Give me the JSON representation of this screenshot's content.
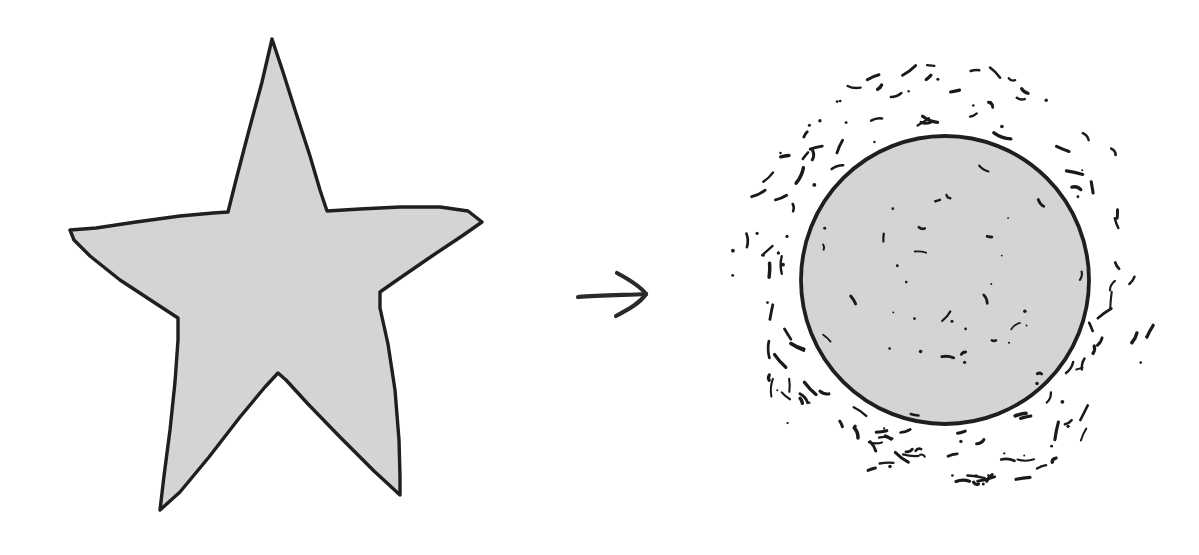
{
  "figure": {
    "background_color": "#ffffff",
    "width": 1199,
    "height": 555,
    "shape_fill_color": "#d4d4d4",
    "outline_color": "#201f1e",
    "mark_color": "#1b1a19",
    "arrow_color": "#2b2a29",
    "relation": "transforms into",
    "arrow_glyph": "→"
  },
  "left_shape": {
    "name": "star",
    "label": "five-pointed star",
    "style": "hand-drawn filled outline",
    "fill": "#d4d4d4",
    "points": 5,
    "center": [
      276,
      280
    ],
    "bounds": [
      70,
      39,
      482,
      510
    ],
    "outer_vertices": [
      [
        272,
        39
      ],
      [
        482,
        222
      ],
      [
        400,
        495
      ],
      [
        160,
        510
      ],
      [
        70,
        230
      ]
    ],
    "inner_vertices": [
      [
        327,
        212
      ],
      [
        380,
        308
      ],
      [
        278,
        373
      ],
      [
        178,
        318
      ],
      [
        228,
        212
      ]
    ],
    "outline_path": "M272,39 L283,72 L296,113 L310,156 L320,190 L327,211 L360,209 L400,207 L440,207 L468,211 L482,222 L462,236 L432,256 L400,278 L380,292 L380,308 L388,344 L395,390 L399,440 L400,476 L400,495 L374,471 L340,437 L308,404 L286,380 L278,373 L265,387 L240,417 L209,457 L180,492 L160,510 L164,476 L170,430 L175,382 L178,340 L178,318 L152,301 L120,280 L90,256 L74,240 L70,230 L96,228 L136,222 L180,216 L213,213 L228,212 L236,180 L248,134 L262,82 Z"
  },
  "middle_symbol": {
    "name": "right-arrow",
    "label": "transformation arrow",
    "glyph": "→",
    "direction": "right",
    "center": [
      611,
      294
    ],
    "shaft_start": [
      578,
      297
    ],
    "shaft_end": [
      646,
      294
    ],
    "barb_upper": [
      617,
      273
    ],
    "barb_lower": [
      616,
      316
    ]
  },
  "right_shape": {
    "name": "stippled-circle",
    "label": "circle with dashed halo",
    "style": "hand-drawn filled circle surrounded by short dash marks",
    "fill": "#d4d4d4",
    "center": [
      945,
      280
    ],
    "radius": 144,
    "bounds": [
      802,
      131,
      1088,
      428
    ],
    "halo": {
      "name": "dash-halo",
      "inner_radius": 152,
      "outer_radius": 216,
      "mark_count": 150,
      "mark_style": "short curved dashes and dots"
    },
    "interior_marks": {
      "name": "interior-specks",
      "mark_count": 38,
      "mark_style": "sparse small dashes and dots"
    }
  }
}
